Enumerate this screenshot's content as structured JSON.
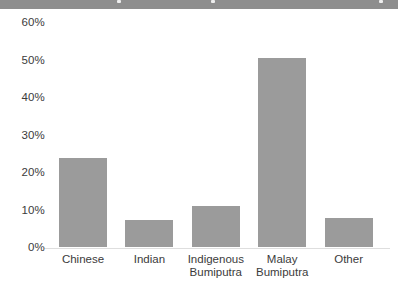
{
  "banner": {
    "color": "#8e8e8e",
    "remnant_color": "#eeeeee"
  },
  "chart_data": {
    "type": "bar",
    "title": "",
    "categories": [
      "Chinese",
      "Indian",
      "Indigenous Bumiputra",
      "Malay Bumiputra",
      "Other"
    ],
    "category_lines": [
      [
        "Chinese"
      ],
      [
        "Indian"
      ],
      [
        "Indigenous",
        "Bumiputra"
      ],
      [
        "Malay",
        "Bumiputra"
      ],
      [
        "Other"
      ]
    ],
    "values": [
      23.7,
      7.1,
      11,
      50.5,
      7.8
    ],
    "unit": "%",
    "xlabel": "",
    "ylabel": "",
    "ylim": [
      0,
      60
    ],
    "yticks": [
      0,
      10,
      20,
      30,
      40,
      50,
      60
    ],
    "ytick_labels": [
      "0%",
      "10%",
      "20%",
      "30%",
      "40%",
      "50%",
      "60%"
    ],
    "grid": false,
    "legend": "none",
    "bar_color": "#9b9b9b",
    "axis_text_color": "#3b3b3b",
    "baseline_color": "#dedede"
  }
}
